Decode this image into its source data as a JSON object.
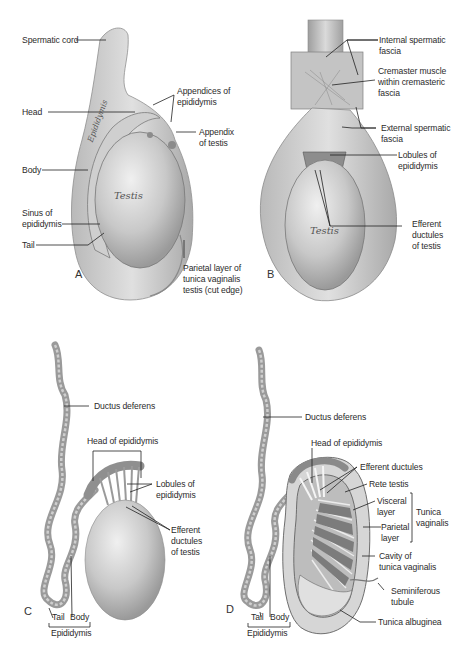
{
  "figure": {
    "panels": [
      {
        "id": "A",
        "letter": "A",
        "labels": {
          "spermatic_cord": "Spermatic cord",
          "appendices_of_epididymis": "Appendices of\nepididymis",
          "head": "Head",
          "appendix_of_testis": "Appendix\nof testis",
          "body": "Body",
          "sinus_of_epididymis": "Sinus of\nepididymis",
          "tail": "Tail",
          "parietal_layer": "Parietal layer of\ntunica vaginalis\ntestis (cut edge)"
        },
        "inline_text": {
          "epididymis": "Epididymis",
          "testis": "Testis"
        }
      },
      {
        "id": "B",
        "letter": "B",
        "labels": {
          "internal_spermatic_fascia": "Internal spermatic\nfascia",
          "cremaster_muscle": "Cremaster muscle\nwithin cremasteric\nfascia",
          "external_spermatic_fascia": "External spermatic\nfascia",
          "lobules_of_epididymis": "Lobules of\nepididymis",
          "efferent_ductules": "Efferent\nductules\nof testis"
        },
        "inline_text": {
          "testis": "Testis"
        }
      },
      {
        "id": "C",
        "letter": "C",
        "labels": {
          "ductus_deferens": "Ductus deferens",
          "head_of_epididymis": "Head of epididymis",
          "lobules_of_epididymis": "Lobules of\nepididymis",
          "efferent_ductules": "Efferent\nductules\nof testis",
          "tail": "Tail",
          "body": "Body",
          "epididymis": "Epididymis"
        }
      },
      {
        "id": "D",
        "letter": "D",
        "labels": {
          "ductus_deferens": "Ductus deferens",
          "head_of_epididymis": "Head of epididymis",
          "efferent_ductules": "Efferent ductules",
          "rete_testis": "Rete testis",
          "visceral_layer": "Visceral\nlayer",
          "parietal_layer": "Parietal\nlayer",
          "tunica_vaginalis": "Tunica\nvaginalis",
          "cavity_of_tunica_vaginalis": "Cavity of\ntunica vaginalis",
          "seminiferous_tubule": "Seminiferous\ntubule",
          "tunica_albuginea": "Tunica albuginea",
          "tail": "Tail",
          "body": "Body",
          "epididymis": "Epididymis"
        }
      }
    ],
    "colors": {
      "background": "#ffffff",
      "tissue_light": "#e2e2e2",
      "tissue_mid": "#bdbdbd",
      "tissue_dark": "#8a8a8a",
      "leader_line": "#222222",
      "label_text": "#2b2b2b"
    }
  }
}
